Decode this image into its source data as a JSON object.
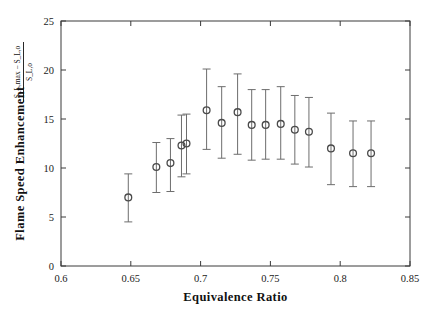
{
  "chart_data": {
    "type": "scatter",
    "title": "",
    "xlabel": "Equivalence Ratio",
    "ylabel": "Flame Speed Enhancement",
    "ylabel_formula_numerator": "S_L,max − S_L,o",
    "ylabel_formula_denominator": "S_L,o",
    "xlim": [
      0.6,
      0.85
    ],
    "ylim": [
      0,
      25
    ],
    "xticks": [
      0.6,
      0.65,
      0.7,
      0.75,
      0.8,
      0.85
    ],
    "xticklabels": [
      "0.6",
      "0.65",
      "0.7",
      "0.75",
      "0.8",
      "0.85"
    ],
    "yticks": [
      0,
      5,
      10,
      15,
      20,
      25
    ],
    "yticklabels": [
      "0",
      "5",
      "10",
      "15",
      "20",
      "25"
    ],
    "grid": false,
    "legend": null,
    "marker": "open-circle",
    "errorbars": true,
    "x": [
      0.6482,
      0.6683,
      0.6784,
      0.6863,
      0.6899,
      0.7043,
      0.7151,
      0.7265,
      0.7366,
      0.7466,
      0.7574,
      0.7675,
      0.7776,
      0.7934,
      0.8092,
      0.8221
    ],
    "y": [
      7.0,
      10.1,
      10.5,
      12.3,
      12.5,
      15.9,
      14.6,
      15.7,
      14.4,
      14.4,
      14.5,
      13.9,
      13.7,
      12.0,
      11.5,
      11.5
    ],
    "yerr_low": [
      2.5,
      2.6,
      2.9,
      3.2,
      3.1,
      4.0,
      3.6,
      4.3,
      3.6,
      3.5,
      3.6,
      3.5,
      3.6,
      3.7,
      3.4,
      3.4
    ],
    "yerr_high": [
      2.4,
      2.5,
      2.5,
      3.1,
      3.0,
      4.2,
      3.7,
      3.9,
      3.6,
      3.6,
      3.8,
      3.5,
      3.5,
      3.6,
      3.3,
      3.3
    ]
  },
  "colors": {
    "axis": "#3a3a3a",
    "marker": "#4a4a4a",
    "errorbar": "#6d6d6d",
    "background": "#ffffff",
    "text": "#1a1a1a"
  }
}
